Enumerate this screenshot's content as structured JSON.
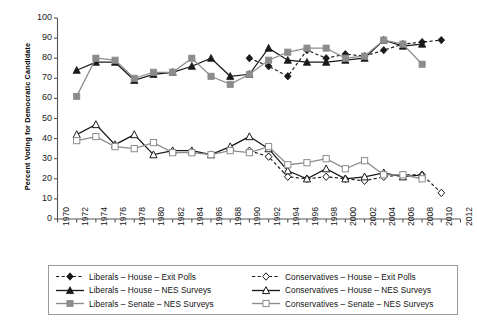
{
  "chart_data": {
    "type": "line",
    "title": "",
    "xlabel": "",
    "ylabel": "Percent Voting for Democratic Candidate",
    "xlim": [
      1970,
      2012
    ],
    "ylim": [
      0,
      100
    ],
    "grid": false,
    "legend_position": "below-axes",
    "xticks": [
      1970,
      1972,
      1974,
      1976,
      1978,
      1980,
      1982,
      1984,
      1986,
      1988,
      1990,
      1992,
      1994,
      1996,
      1998,
      2000,
      2002,
      2004,
      2006,
      2008,
      2010,
      2012
    ],
    "yticks": [
      0,
      10,
      20,
      30,
      40,
      50,
      60,
      70,
      80,
      90,
      100
    ],
    "series": [
      {
        "name": "Liberals – House – Exit Polls",
        "color": "#1a1a1a",
        "dash": "dashed",
        "marker": "diamond-filled",
        "x": [
          1990,
          1992,
          1994,
          1996,
          1998,
          2000,
          2002,
          2004,
          2006,
          2008,
          2010
        ],
        "values": [
          80,
          76,
          71,
          84,
          80,
          82,
          81,
          84,
          87,
          88,
          89
        ]
      },
      {
        "name": "Liberals – House – NES Surveys",
        "color": "#1a1a1a",
        "dash": "solid",
        "marker": "triangle-filled",
        "x": [
          1972,
          1974,
          1976,
          1978,
          1980,
          1982,
          1984,
          1986,
          1988,
          1990,
          1992,
          1994,
          1996,
          1998,
          2000,
          2002,
          2004,
          2006,
          2008
        ],
        "values": [
          74,
          78,
          78,
          69,
          72,
          73,
          76,
          80,
          71,
          72,
          85,
          79,
          78,
          78,
          79,
          80,
          89,
          86,
          87
        ]
      },
      {
        "name": "Liberals – Senate – NES Surveys",
        "color": "#8c8c8c",
        "dash": "solid",
        "marker": "square-filled",
        "x": [
          1972,
          1974,
          1976,
          1978,
          1980,
          1982,
          1984,
          1986,
          1988,
          1990,
          1992,
          1994,
          1996,
          1998,
          2000,
          2002,
          2004,
          2006,
          2008
        ],
        "values": [
          61,
          80,
          79,
          70,
          73,
          73,
          80,
          71,
          67,
          72,
          79,
          83,
          85,
          85,
          80,
          81,
          89,
          87,
          77
        ]
      },
      {
        "name": "Conservatives – House – Exit Polls",
        "color": "#1a1a1a",
        "dash": "dashed",
        "marker": "diamond-open",
        "x": [
          1990,
          1992,
          1994,
          1996,
          1998,
          2000,
          2002,
          2004,
          2006,
          2008,
          2010
        ],
        "values": [
          34,
          31,
          21,
          20,
          21,
          20,
          19,
          21,
          22,
          22,
          13
        ]
      },
      {
        "name": "Conservatives – House – NES Surveys",
        "color": "#1a1a1a",
        "dash": "solid",
        "marker": "triangle-open",
        "x": [
          1972,
          1974,
          1976,
          1978,
          1980,
          1982,
          1984,
          1986,
          1988,
          1990,
          1992,
          1994,
          1996,
          1998,
          2000,
          2002,
          2004,
          2006,
          2008
        ],
        "values": [
          42,
          47,
          37,
          42,
          32,
          34,
          34,
          32,
          36,
          41,
          35,
          24,
          20,
          25,
          20,
          21,
          23,
          21,
          22
        ]
      },
      {
        "name": "Conservatives – Senate – NES Surveys",
        "color": "#8c8c8c",
        "dash": "solid",
        "marker": "square-open",
        "x": [
          1972,
          1974,
          1976,
          1978,
          1980,
          1982,
          1984,
          1986,
          1988,
          1990,
          1992,
          1994,
          1996,
          1998,
          2000,
          2002,
          2004,
          2006,
          2008
        ],
        "values": [
          39,
          41,
          36,
          35,
          38,
          33,
          33,
          32,
          34,
          33,
          36,
          27,
          28,
          30,
          25,
          29,
          22,
          22,
          20
        ]
      }
    ]
  },
  "legend": {
    "entries": [
      {
        "label": "Liberals – House – Exit Polls"
      },
      {
        "label": "Conservatives – House – Exit Polls"
      },
      {
        "label": "Liberals – House – NES Surveys"
      },
      {
        "label": "Conservatives – House – NES Surveys"
      },
      {
        "label": "Liberals – Senate – NES Surveys"
      },
      {
        "label": "Conservatives – Senate – NES Surveys"
      }
    ]
  },
  "colors": {
    "dark": "#1a1a1a",
    "gray": "#8c8c8c",
    "axis": "#555555",
    "legend_border": "#9a9a9a"
  }
}
